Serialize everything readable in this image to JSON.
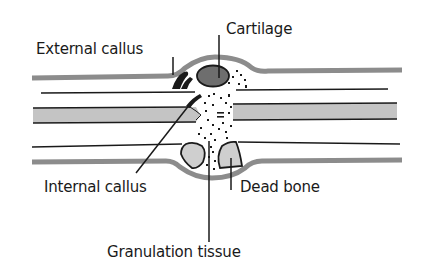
{
  "diagram": {
    "labels": {
      "cartilage": "Cartilage",
      "external_callus": "External callus",
      "internal_callus": "Internal callus",
      "dead_bone": "Dead bone",
      "granulation_tissue": "Granulation tissue"
    },
    "colors": {
      "background": "#ffffff",
      "line": "#1a1a1a",
      "periosteum": "#8c8c8c",
      "marrow_band": "#c4c4c4",
      "cartilage_fill": "#6e6e6e",
      "dead_bone_fill": "#cfcfcf",
      "callus_fill": "#1a1a1a"
    }
  }
}
